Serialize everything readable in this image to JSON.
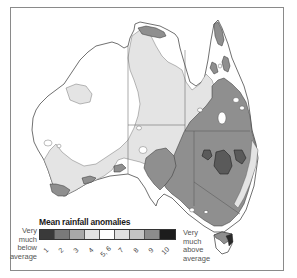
{
  "map": {
    "title": "Mean rainfall anomalies",
    "region": "Australia",
    "fill_colors": {
      "land_default": "#ffffff",
      "class_4": "#e6e6e6",
      "class_5_6": "#ffffff",
      "class_7": "#e0e0e0",
      "class_8": "#c8c8c8",
      "class_9": "#8f8f8f",
      "class_10": "#222222",
      "outline": "#333333",
      "state_border": "#555555"
    }
  },
  "legend": {
    "title": "Mean rainfall anomalies",
    "left_label": [
      "Very",
      "much",
      "below",
      "average"
    ],
    "right_label": [
      "Very",
      "much",
      "above",
      "average"
    ],
    "classes": [
      {
        "label": "1",
        "color": "#3a3a3a"
      },
      {
        "label": "2",
        "color": "#7a7a7a"
      },
      {
        "label": "3",
        "color": "#a8a8a8"
      },
      {
        "label": "4",
        "color": "#e2e2e2"
      },
      {
        "label": "5, 6",
        "color": "#ffffff"
      },
      {
        "label": "7",
        "color": "#e0e0e0"
      },
      {
        "label": "8",
        "color": "#c4c4c4"
      },
      {
        "label": "9",
        "color": "#8c8c8c"
      },
      {
        "label": "10",
        "color": "#1c1c1c"
      }
    ]
  }
}
